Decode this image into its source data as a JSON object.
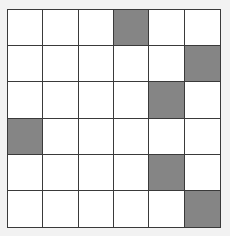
{
  "grid": {
    "rows": 6,
    "cols": 6,
    "fill_color": "#858585",
    "empty_color": "#ffffff",
    "line_color": "#3a3a3a",
    "filled_cells": [
      {
        "row": 0,
        "col": 3
      },
      {
        "row": 1,
        "col": 5
      },
      {
        "row": 2,
        "col": 4
      },
      {
        "row": 3,
        "col": 0
      },
      {
        "row": 4,
        "col": 4
      },
      {
        "row": 5,
        "col": 5
      }
    ],
    "cells": [
      [
        0,
        0,
        0,
        1,
        0,
        0
      ],
      [
        0,
        0,
        0,
        0,
        0,
        1
      ],
      [
        0,
        0,
        0,
        0,
        1,
        0
      ],
      [
        1,
        0,
        0,
        0,
        0,
        0
      ],
      [
        0,
        0,
        0,
        0,
        1,
        0
      ],
      [
        0,
        0,
        0,
        0,
        0,
        1
      ]
    ]
  }
}
